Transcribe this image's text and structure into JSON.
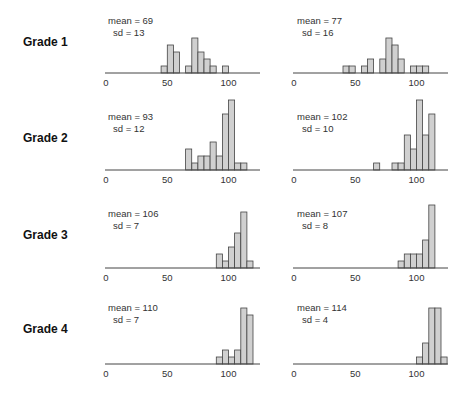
{
  "chart_data": {
    "type": "bar",
    "title": "",
    "xlabel": "",
    "ylabel": "",
    "grid": false,
    "bin_width": 5,
    "x_ticks": [
      "0",
      "50",
      "100"
    ],
    "xlim": [
      0,
      125
    ],
    "rows": [
      {
        "label": "Grade 1",
        "panels": [
          {
            "mean_text": "mean = 69",
            "sd_text": "sd = 13",
            "mean": 69,
            "sd": 13,
            "bins": [
              [
                45,
                1
              ],
              [
                50,
                4
              ],
              [
                55,
                3
              ],
              [
                65,
                1
              ],
              [
                70,
                5
              ],
              [
                75,
                3
              ],
              [
                80,
                2
              ],
              [
                85,
                1
              ],
              [
                95,
                1
              ]
            ]
          },
          {
            "mean_text": "mean = 77",
            "sd_text": "sd = 16",
            "mean": 77,
            "sd": 16,
            "bins": [
              [
                40,
                1
              ],
              [
                45,
                1
              ],
              [
                55,
                1
              ],
              [
                60,
                2
              ],
              [
                70,
                2
              ],
              [
                75,
                5
              ],
              [
                80,
                4
              ],
              [
                85,
                2
              ],
              [
                95,
                1
              ],
              [
                100,
                1
              ],
              [
                105,
                1
              ]
            ]
          }
        ]
      },
      {
        "label": "Grade 2",
        "panels": [
          {
            "mean_text": "mean = 93",
            "sd_text": "sd = 12",
            "mean": 93,
            "sd": 12,
            "bins": [
              [
                65,
                3
              ],
              [
                70,
                1
              ],
              [
                75,
                2
              ],
              [
                80,
                2
              ],
              [
                85,
                4
              ],
              [
                90,
                2
              ],
              [
                95,
                8
              ],
              [
                100,
                10
              ],
              [
                105,
                1
              ],
              [
                110,
                1
              ]
            ]
          },
          {
            "mean_text": "mean = 102",
            "sd_text": "sd = 10",
            "mean": 102,
            "sd": 10,
            "bins": [
              [
                65,
                1
              ],
              [
                80,
                1
              ],
              [
                85,
                1
              ],
              [
                90,
                5
              ],
              [
                95,
                3
              ],
              [
                100,
                10
              ],
              [
                105,
                5
              ],
              [
                110,
                8
              ]
            ]
          }
        ]
      },
      {
        "label": "Grade 3",
        "panels": [
          {
            "mean_text": "mean = 106",
            "sd_text": "sd = 7",
            "mean": 106,
            "sd": 7,
            "bins": [
              [
                90,
                2
              ],
              [
                95,
                1
              ],
              [
                100,
                3
              ],
              [
                105,
                5
              ],
              [
                110,
                8
              ],
              [
                115,
                1
              ]
            ]
          },
          {
            "mean_text": "mean = 107",
            "sd_text": "sd = 8",
            "mean": 107,
            "sd": 8,
            "bins": [
              [
                85,
                1
              ],
              [
                90,
                2
              ],
              [
                95,
                2
              ],
              [
                100,
                2
              ],
              [
                105,
                4
              ],
              [
                110,
                9
              ]
            ]
          }
        ]
      },
      {
        "label": "Grade 4",
        "panels": [
          {
            "mean_text": "mean = 110",
            "sd_text": "sd = 7",
            "mean": 110,
            "sd": 7,
            "bins": [
              [
                90,
                1
              ],
              [
                95,
                2
              ],
              [
                100,
                1
              ],
              [
                105,
                2
              ],
              [
                110,
                8
              ],
              [
                115,
                7
              ]
            ]
          },
          {
            "mean_text": "mean = 114",
            "sd_text": "sd = 4",
            "mean": 114,
            "sd": 4,
            "bins": [
              [
                100,
                1
              ],
              [
                105,
                3
              ],
              [
                110,
                8
              ],
              [
                115,
                8
              ],
              [
                120,
                1
              ]
            ]
          }
        ]
      }
    ]
  },
  "style": {
    "bar_fill": "#d0d0d0",
    "bar_stroke": "#444444",
    "axis_color": "#444444"
  }
}
